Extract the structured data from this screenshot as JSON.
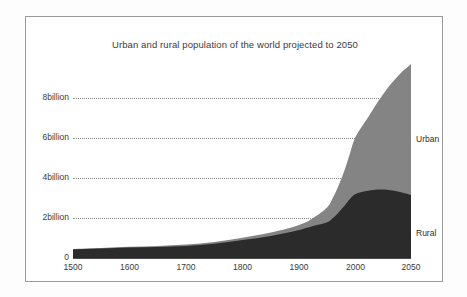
{
  "chart_data": {
    "type": "area",
    "title": "Urban and rural population of the world projected to 2050",
    "xlabel": "",
    "ylabel": "",
    "stacked": true,
    "grid": true,
    "legend_position": "right-inline",
    "xlim": [
      1500,
      2050
    ],
    "ylim": [
      0,
      10
    ],
    "xticks": [
      1500,
      1600,
      1700,
      1800,
      1900,
      2000,
      2050
    ],
    "xtick_labels": [
      "1500",
      "1600",
      "1700",
      "1800",
      "1900",
      "2000",
      "2050"
    ],
    "yticks": [
      0,
      2,
      4,
      6,
      8
    ],
    "ytick_labels": [
      "0",
      "2billion",
      "4billion",
      "6billion",
      "8billion"
    ],
    "x": [
      1500,
      1550,
      1600,
      1650,
      1700,
      1750,
      1800,
      1850,
      1900,
      1925,
      1950,
      1960,
      1970,
      1980,
      1990,
      2000,
      2010,
      2020,
      2030,
      2040,
      2050
    ],
    "series": [
      {
        "name": "Rural",
        "color": "#2b2b2b",
        "label": "Rural",
        "values": [
          0.43,
          0.47,
          0.52,
          0.55,
          0.6,
          0.71,
          0.9,
          1.1,
          1.4,
          1.6,
          1.79,
          2.0,
          2.28,
          2.6,
          2.95,
          3.2,
          3.35,
          3.42,
          3.4,
          3.3,
          3.15
        ]
      },
      {
        "name": "Urban",
        "color": "#848484",
        "label": "Urban",
        "values": [
          0.02,
          0.03,
          0.04,
          0.05,
          0.07,
          0.09,
          0.11,
          0.17,
          0.25,
          0.4,
          0.75,
          1.02,
          1.35,
          1.75,
          2.28,
          2.86,
          3.57,
          4.38,
          5.17,
          5.9,
          6.55
        ]
      }
    ],
    "totals": [
      0.45,
      0.5,
      0.56,
      0.6,
      0.67,
      0.8,
      1.01,
      1.27,
      1.65,
      2.0,
      2.54,
      3.02,
      3.63,
      4.35,
      5.23,
      6.06,
      6.92,
      7.8,
      8.57,
      9.2,
      9.7
    ],
    "annotations": [
      {
        "text": "Urban",
        "x": 2050,
        "y": 6.5
      },
      {
        "text": "Rural",
        "x": 2050,
        "y": 2.0
      }
    ]
  },
  "colors": {
    "rural": "#2b2b2b",
    "urban": "#848484",
    "grid": "#8d8d8d",
    "axis": "#4a4a4a",
    "frame": "#9a9a9a",
    "text": "#3a3a3a",
    "background": "#ffffff"
  }
}
